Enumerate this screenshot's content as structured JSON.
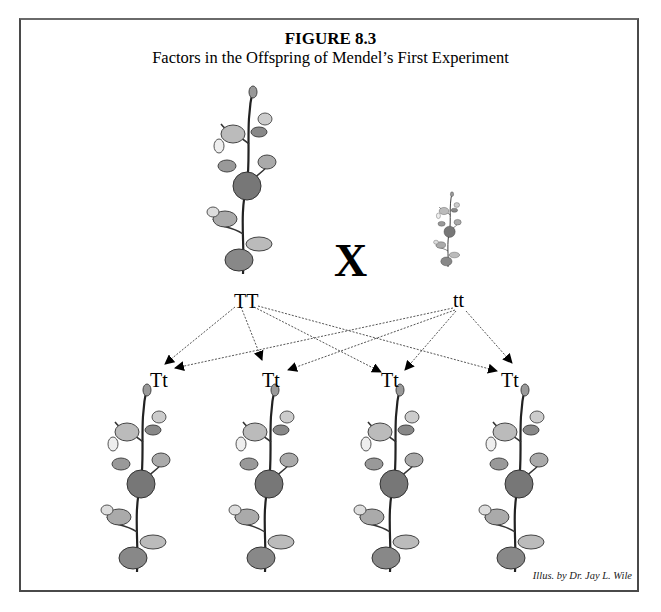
{
  "figure": {
    "title": "FIGURE 8.3",
    "subtitle": "Factors in the Offspring of Mendel’s First Experiment",
    "credit": "Illus. by Dr. Jay L. Wile"
  },
  "parents": {
    "tall": {
      "genotype": "TT",
      "plant": "tall-pea-plant"
    },
    "short": {
      "genotype": "tt",
      "plant": "short-pea-plant"
    },
    "cross_symbol": "X"
  },
  "offspring": [
    {
      "genotype": "Tt"
    },
    {
      "genotype": "Tt"
    },
    {
      "genotype": "Tt"
    },
    {
      "genotype": "Tt"
    }
  ],
  "colors": {
    "line": "#555555",
    "border": "#4a4a4a",
    "plant": "#7a7a7a"
  }
}
